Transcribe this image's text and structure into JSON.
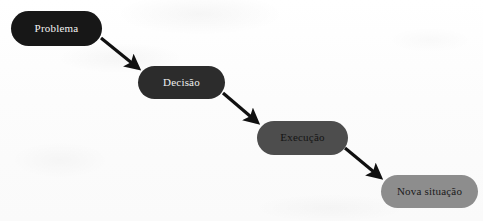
{
  "diagram": {
    "canvas": {
      "width": 483,
      "height": 221,
      "background": "#fdfdfd"
    },
    "nodes": [
      {
        "id": "problema",
        "label": "Problema",
        "shape": "rounded-rectangle",
        "fill": "#171717",
        "text_color": "#f2f2f2",
        "x": 11,
        "y": 11,
        "width": 91,
        "height": 35,
        "font_size": 11
      },
      {
        "id": "decisao",
        "label": "Decisão",
        "shape": "rounded-rectangle",
        "fill": "#2c2c2c",
        "text_color": "#f0f0f0",
        "x": 138,
        "y": 66,
        "width": 87,
        "height": 33,
        "font_size": 11
      },
      {
        "id": "execucao",
        "label": "Execução",
        "shape": "rounded-rectangle",
        "fill": "#4d4d4d",
        "text_color": "#141414",
        "x": 257,
        "y": 121,
        "width": 91,
        "height": 34,
        "font_size": 11
      },
      {
        "id": "nova-situacao",
        "label": "Nova situação",
        "shape": "rounded-rectangle",
        "fill": "#8d8d8d",
        "text_color": "#1a1a1a",
        "x": 381,
        "y": 175,
        "width": 97,
        "height": 33,
        "font_size": 11
      }
    ],
    "arrows": [
      {
        "id": "arrow-problema-decisao",
        "from": "problema",
        "to": "decisao",
        "color": "#101010",
        "x1": 101,
        "y1": 38,
        "x2": 138,
        "y2": 68,
        "stroke_width": 3.2
      },
      {
        "id": "arrow-decisao-execucao",
        "from": "decisao",
        "to": "execucao",
        "color": "#101010",
        "x1": 223,
        "y1": 93,
        "x2": 257,
        "y2": 122,
        "stroke_width": 3.2
      },
      {
        "id": "arrow-execucao-nova-situacao",
        "from": "execucao",
        "to": "nova-situacao",
        "color": "#101010",
        "x1": 345,
        "y1": 148,
        "x2": 380,
        "y2": 177,
        "stroke_width": 3.2
      }
    ]
  }
}
